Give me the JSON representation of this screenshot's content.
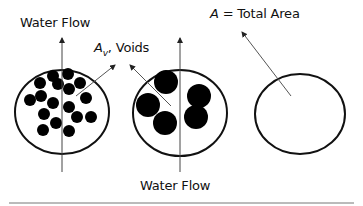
{
  "labels": {
    "water_flow_top": "Water Flow",
    "voids_symbol": "A",
    "voids_subscript": "v",
    "voids_text": ", Voids",
    "total_area_symbol": "A",
    "total_area_text": " = Total Area",
    "water_flow_bottom": "Water Flow"
  },
  "panels": [
    {
      "name": "fine-particles",
      "description": "Many small solid particles in cross-section"
    },
    {
      "name": "coarse-particles",
      "description": "Few large solid particles in cross-section"
    },
    {
      "name": "total-area",
      "description": "Empty cross-section representing total area"
    }
  ],
  "colors": {
    "outline": "#111111",
    "particle": "#000000",
    "arrow": "#555555",
    "baseline": "#777777"
  }
}
